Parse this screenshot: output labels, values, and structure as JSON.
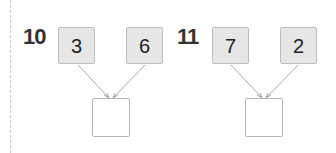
{
  "problems": [
    {
      "number": "10",
      "left": "3",
      "right": "6",
      "answer": ""
    },
    {
      "number": "11",
      "left": "7",
      "right": "2",
      "answer": ""
    }
  ]
}
